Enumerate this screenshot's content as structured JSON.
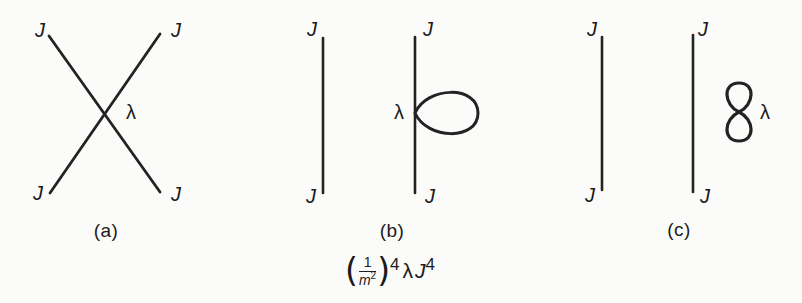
{
  "figure": {
    "ink_color": "#232323",
    "background_color": "#fbfbfa",
    "diagrams": [
      {
        "caption": "(a)",
        "coupling_label": "λ",
        "source_labels": [
          "J",
          "J",
          "J",
          "J"
        ]
      },
      {
        "caption": "(b)",
        "coupling_label": "λ",
        "source_labels": [
          "J",
          "J",
          "J",
          "J"
        ]
      },
      {
        "caption": "(c)",
        "coupling_label": "λ",
        "source_labels": [
          "J",
          "J",
          "J",
          "J"
        ]
      }
    ],
    "formula": {
      "open_paren": "(",
      "fraction_numerator": "1",
      "fraction_denominator_base": "m",
      "fraction_denominator_exponent": "2",
      "close_paren": ")",
      "paren_exponent": "4",
      "coupling": "λ",
      "source": "J",
      "source_exponent": "4"
    }
  }
}
